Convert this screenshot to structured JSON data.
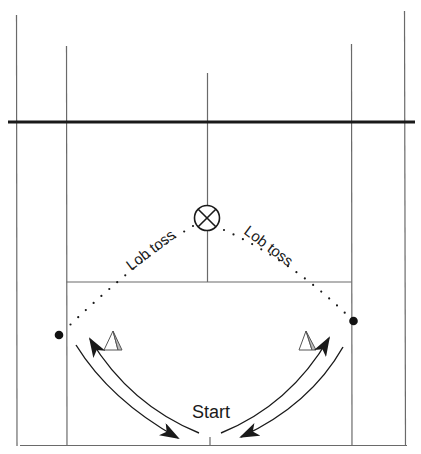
{
  "diagram": {
    "type": "tennis-drill",
    "labels": {
      "lob_left": "Lob toss",
      "lob_right": "Lob toss",
      "start": "Start"
    },
    "elements": {
      "target": "circle-x-target",
      "players": [
        "left-player-dot",
        "right-player-dot"
      ],
      "cones": [
        "left-cone",
        "right-cone"
      ],
      "movement": [
        "left-forward-arc",
        "left-return-arc",
        "right-forward-arc",
        "right-return-arc"
      ]
    },
    "colors": {
      "line": "#6a6a6a",
      "net": "#1a1a1a",
      "ink": "#1a1a1a",
      "cone_fill_light": "#ffffff",
      "cone_fill_shade": "#bdbdbd"
    }
  }
}
